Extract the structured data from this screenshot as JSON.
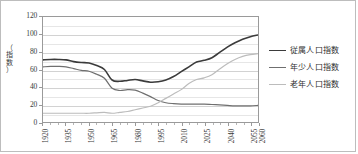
{
  "chart_data": {
    "type": "line",
    "title": "",
    "xlabel": "",
    "ylabel": "（指数）",
    "ylabel_chars": [
      "（",
      "指",
      "数",
      "）"
    ],
    "xlim": [
      1920,
      2060
    ],
    "ylim": [
      0,
      120
    ],
    "yticks": [
      0,
      20,
      40,
      60,
      80,
      100,
      120
    ],
    "ytick_labels": [
      "0",
      "20",
      "40",
      "60",
      "80",
      "100",
      "120"
    ],
    "minor_ytick_step": 10,
    "xticks": [
      1920,
      1935,
      1950,
      1965,
      1980,
      1995,
      2010,
      2025,
      2040,
      2055,
      2060
    ],
    "xtick_labels": [
      "1920",
      "1935",
      "1950",
      "1965",
      "1980",
      "1995",
      "2010",
      "2025",
      "2040",
      "2055",
      "2060"
    ],
    "minor_xtick_step": 5,
    "grid": true,
    "legend_position": "right",
    "x": [
      1920,
      1925,
      1930,
      1935,
      1940,
      1945,
      1950,
      1955,
      1960,
      1965,
      1970,
      1975,
      1980,
      1985,
      1990,
      1995,
      2000,
      2005,
      2010,
      2015,
      2020,
      2025,
      2030,
      2035,
      2040,
      2045,
      2050,
      2055,
      2060
    ],
    "series": [
      {
        "name": "従属人口指数",
        "color": "#3b3b3b",
        "width": 1.6,
        "values": [
          71,
          71.5,
          71.5,
          71,
          69,
          68,
          67.5,
          64.5,
          60,
          48,
          46.5,
          47.5,
          48.5,
          47,
          45.5,
          46,
          48,
          52,
          57.5,
          63,
          68.5,
          70.5,
          73.5,
          79.5,
          85.5,
          90.5,
          94.5,
          97.5,
          99.5
        ]
      },
      {
        "name": "年少人口指数",
        "color": "#6f6f6f",
        "width": 1.2,
        "values": [
          63,
          63.5,
          63.5,
          63,
          61,
          59,
          58,
          54.5,
          50,
          38.5,
          36,
          37,
          36.5,
          33,
          29,
          24.5,
          22,
          21,
          20.5,
          20.5,
          20.5,
          20.5,
          20,
          19.5,
          19,
          18.5,
          18.5,
          18.5,
          19
        ]
      },
      {
        "name": "老年人口指数",
        "color": "#bcbcbc",
        "width": 1.2,
        "values": [
          10,
          10,
          10,
          10,
          10,
          10,
          10,
          10.5,
          11,
          10,
          11,
          12,
          14,
          16,
          18,
          22,
          27,
          32,
          37,
          44,
          48.5,
          50.5,
          54,
          60.5,
          66.5,
          71.5,
          75,
          77,
          78
        ]
      }
    ]
  },
  "legend": {
    "items": [
      {
        "label": "従属人口指数"
      },
      {
        "label": "年少人口指数"
      },
      {
        "label": "老年人口指数"
      }
    ]
  }
}
